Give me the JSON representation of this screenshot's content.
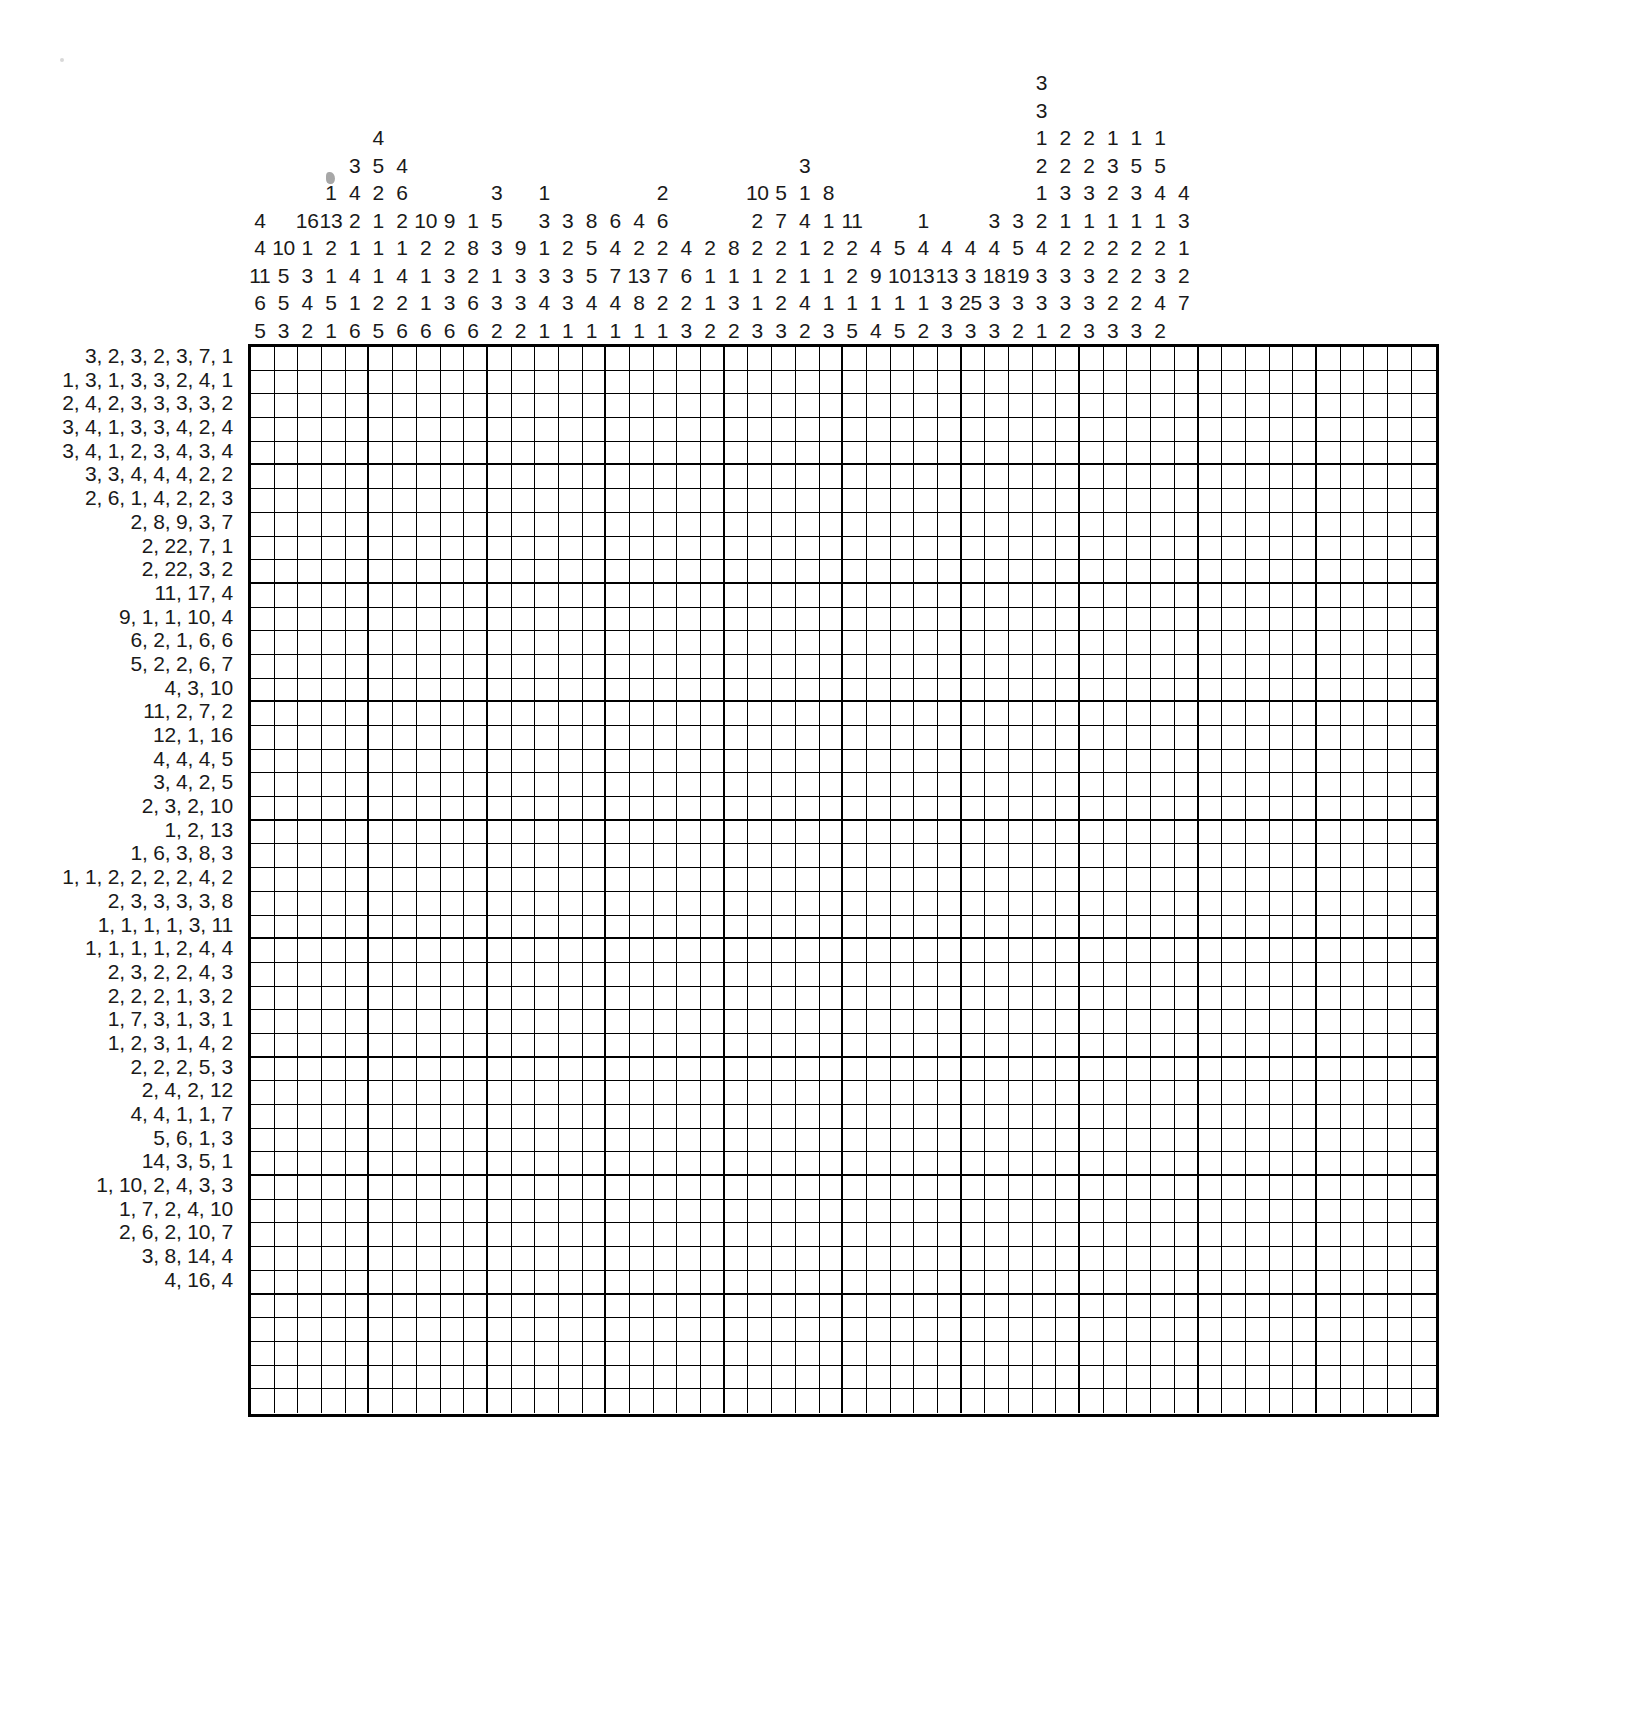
{
  "puzzle": {
    "type": "nonogram",
    "title": "Nonogram / Picross grid puzzle",
    "grid": {
      "columns": 50,
      "rows": 45,
      "block_size": 5
    },
    "colors": {
      "ink": "#1a1a1a",
      "grid_line": "#000000",
      "background": "#ffffff"
    },
    "artifact_label": "dust-speck"
  },
  "column_clues": [
    [
      4,
      11,
      6,
      5
    ],
    [
      4,
      10,
      5,
      5,
      3
    ],
    [
      16,
      1,
      3,
      4,
      2
    ],
    [
      1,
      13,
      2,
      1,
      5,
      1
    ],
    [
      3,
      4,
      2,
      1,
      4,
      1,
      6
    ],
    [
      4,
      5,
      2,
      1,
      1,
      1,
      2,
      5
    ],
    [
      4,
      6,
      2,
      1,
      4,
      2,
      6
    ],
    [
      10,
      2,
      1,
      1,
      6
    ],
    [
      9,
      2,
      3,
      3,
      6
    ],
    [
      1,
      2,
      8,
      2,
      6
    ],
    [
      3,
      5,
      3,
      1,
      3,
      2
    ],
    [
      9,
      3,
      3,
      2
    ],
    [
      1,
      3,
      1,
      3,
      1
    ],
    [
      8,
      2,
      3,
      3,
      1
    ],
    [
      6,
      5,
      5,
      4,
      1
    ],
    [
      4,
      4,
      7,
      4,
      1
    ],
    [
      6,
      2,
      13,
      8,
      1
    ],
    [
      2,
      7,
      2,
      3
    ],
    [
      6,
      2,
      2
    ],
    [
      8,
      1,
      1,
      2
    ],
    [
      10,
      2,
      2,
      1,
      3
    ],
    [
      5,
      7,
      2,
      1,
      2,
      3
    ],
    [
      1,
      4,
      1,
      2,
      1,
      2
    ],
    [
      8,
      1,
      2,
      4,
      3
    ],
    [
      11,
      2,
      2,
      1,
      2
    ],
    [
      4,
      9,
      1,
      5
    ],
    [
      5,
      10,
      1,
      4
    ],
    [
      4,
      13,
      1,
      5
    ],
    [
      1,
      4,
      13,
      1,
      2
    ],
    [
      4,
      3,
      3,
      3
    ],
    [
      4,
      18,
      25,
      3
    ],
    [
      3,
      5,
      19,
      3
    ],
    [
      3,
      3,
      2,
      1,
      2,
      4,
      3,
      3
    ],
    [
      3,
      1,
      2,
      2,
      1,
      3,
      1,
      2,
      3
    ],
    [
      2,
      2,
      3,
      1,
      2,
      3,
      3
    ],
    [
      1,
      3,
      2,
      1,
      2,
      2,
      2
    ],
    [
      1,
      5,
      3,
      1,
      2,
      2,
      2
    ],
    [
      1,
      2,
      3,
      1,
      2,
      3,
      2
    ],
    [
      1,
      3,
      4,
      1,
      2,
      2,
      2
    ],
    [
      4,
      3,
      1,
      2,
      7
    ]
  ],
  "column_clue_columns": [
    [
      "",
      "",
      "",
      "",
      "4",
      "4",
      "11",
      "6",
      "5"
    ],
    [
      "",
      "",
      "",
      "",
      "",
      "10",
      "5",
      "5",
      "3"
    ],
    [
      "",
      "",
      "",
      "",
      "16",
      "1",
      "3",
      "4",
      "2"
    ],
    [
      "",
      "",
      "",
      "1",
      "13",
      "2",
      "1",
      "5",
      "1"
    ],
    [
      "",
      "",
      "3",
      "4",
      "2",
      "1",
      "4",
      "1",
      "6"
    ],
    [
      "",
      "4",
      "5",
      "2",
      "1",
      "1",
      "1",
      "2",
      "5"
    ],
    [
      "",
      "",
      "4",
      "6",
      "2",
      "1",
      "4",
      "2",
      "6"
    ],
    [
      "",
      "",
      "",
      "",
      "10",
      "2",
      "1",
      "1",
      "6"
    ],
    [
      "",
      "",
      "",
      "",
      "9",
      "2",
      "3",
      "3",
      "6"
    ],
    [
      "",
      "",
      "",
      "",
      "1",
      "8",
      "2",
      "6",
      "6"
    ],
    [
      "",
      "",
      "",
      "3",
      "5",
      "3",
      "1",
      "3",
      "2"
    ],
    [
      "",
      "",
      "",
      "",
      "",
      "9",
      "3",
      "3",
      "2"
    ],
    [
      "",
      "",
      "",
      "1",
      "3",
      "1",
      "3",
      "4",
      "1"
    ],
    [
      "",
      "",
      "",
      "",
      "3",
      "2",
      "3",
      "3",
      "1"
    ],
    [
      "",
      "",
      "",
      "",
      "8",
      "5",
      "5",
      "4",
      "1"
    ],
    [
      "",
      "",
      "",
      "",
      "6",
      "4",
      "7",
      "4",
      "1"
    ],
    [
      "",
      "",
      "",
      "",
      "4",
      "2",
      "13",
      "8",
      "1"
    ],
    [
      "",
      "",
      "",
      "2",
      "6",
      "2",
      "7",
      "2",
      "1"
    ],
    [
      "",
      "",
      "",
      "",
      "",
      "4",
      "6",
      "2",
      "3"
    ],
    [
      "",
      "",
      "",
      "",
      "",
      "2",
      "1",
      "1",
      "2"
    ],
    [
      "",
      "",
      "",
      "",
      "",
      "8",
      "1",
      "3",
      "2"
    ],
    [
      "",
      "",
      "",
      "10",
      "2",
      "2",
      "1",
      "1",
      "3"
    ],
    [
      "",
      "",
      "",
      "5",
      "7",
      "2",
      "2",
      "2",
      "3"
    ],
    [
      "",
      "",
      "3",
      "1",
      "4",
      "1",
      "1",
      "4",
      "2"
    ],
    [
      "",
      "",
      "",
      "8",
      "1",
      "2",
      "1",
      "1",
      "3"
    ],
    [
      "",
      "",
      "",
      "",
      "11",
      "2",
      "2",
      "1",
      "5"
    ],
    [
      "",
      "",
      "",
      "",
      "",
      "4",
      "9",
      "1",
      "4"
    ],
    [
      "",
      "",
      "",
      "",
      "",
      "5",
      "10",
      "1",
      "5"
    ],
    [
      "",
      "",
      "",
      "",
      "1",
      "4",
      "13",
      "1",
      "2"
    ],
    [
      "",
      "",
      "",
      "",
      "",
      "4",
      "13",
      "3",
      "3"
    ],
    [
      "",
      "",
      "",
      "",
      "",
      "4",
      "3",
      "25",
      "3"
    ],
    [
      "",
      "",
      "",
      "",
      "3",
      "4",
      "18",
      "3",
      "3"
    ],
    [
      "",
      "",
      "",
      "",
      "3",
      "5",
      "19",
      "3",
      "2"
    ],
    [
      "3",
      "3",
      "1",
      "2",
      "2",
      "4",
      "3",
      "3",
      "1"
    ],
    [
      "",
      "",
      "2",
      "2",
      "3",
      "1",
      "2",
      "3",
      "2"
    ],
    [
      "",
      "",
      "2",
      "2",
      "3",
      "1",
      "2",
      "3",
      "3"
    ],
    [
      "",
      "",
      "1",
      "3",
      "2",
      "1",
      "2",
      "2",
      "3"
    ],
    [
      "",
      "",
      "1",
      "5",
      "3",
      "1",
      "2",
      "2",
      "3"
    ],
    [
      "",
      "",
      "1",
      "5",
      "4",
      "1",
      "2",
      "2",
      "2"
    ],
    [
      "",
      "",
      "",
      "4",
      "3",
      "1",
      "2",
      "7",
      ""
    ]
  ],
  "column_clue_grid": [
    [
      "",
      "",
      "",
      "",
      "",
      "4",
      "4",
      "11",
      "6",
      "5"
    ],
    [
      "",
      "",
      "",
      "",
      "",
      "",
      "10",
      "5",
      "5",
      "3"
    ],
    [
      "",
      "",
      "",
      "",
      "",
      "16",
      "1",
      "3",
      "4",
      "2"
    ],
    [
      "",
      "",
      "",
      "",
      "1",
      "13",
      "2",
      "1",
      "5",
      "1"
    ],
    [
      "",
      "",
      "",
      "3",
      "4",
      "2",
      "1",
      "4",
      "1",
      "6"
    ],
    [
      "",
      "",
      "4",
      "5",
      "2",
      "1",
      "1",
      "1",
      "2",
      "5"
    ],
    [
      "",
      "",
      "",
      "4",
      "6",
      "2",
      "1",
      "4",
      "2",
      "6"
    ],
    [
      "",
      "",
      "",
      "",
      "",
      "10",
      "2",
      "1",
      "1",
      "6"
    ],
    [
      "",
      "",
      "",
      "",
      "",
      "9",
      "2",
      "3",
      "3",
      "6"
    ],
    [
      "",
      "",
      "",
      "",
      "",
      "1",
      "8",
      "2",
      "6",
      "6"
    ],
    [
      "",
      "",
      "",
      "",
      "3",
      "5",
      "3",
      "1",
      "3",
      "2"
    ],
    [
      "",
      "",
      "",
      "",
      "",
      "",
      "9",
      "3",
      "3",
      "2"
    ],
    [
      "",
      "",
      "",
      "",
      "1",
      "3",
      "1",
      "3",
      "4",
      "1"
    ],
    [
      "",
      "",
      "",
      "",
      "",
      "3",
      "2",
      "3",
      "3",
      "1"
    ],
    [
      "",
      "",
      "",
      "",
      "",
      "8",
      "5",
      "5",
      "4",
      "1"
    ],
    [
      "",
      "",
      "",
      "",
      "",
      "6",
      "4",
      "7",
      "4",
      "1"
    ],
    [
      "",
      "",
      "",
      "",
      "",
      "4",
      "2",
      "13",
      "8",
      "1"
    ],
    [
      "",
      "",
      "",
      "",
      "2",
      "6",
      "2",
      "7",
      "2",
      "1"
    ],
    [
      "",
      "",
      "",
      "",
      "",
      "",
      "4",
      "6",
      "2",
      "3"
    ],
    [
      "",
      "",
      "",
      "",
      "",
      "",
      "2",
      "1",
      "1",
      "2"
    ],
    [
      "",
      "",
      "",
      "",
      "",
      "",
      "8",
      "1",
      "3",
      "2"
    ],
    [
      "",
      "",
      "",
      "",
      "10",
      "2",
      "2",
      "1",
      "1",
      "3"
    ],
    [
      "",
      "",
      "",
      "",
      "5",
      "7",
      "2",
      "2",
      "2",
      "3"
    ],
    [
      "",
      "",
      "",
      "3",
      "1",
      "4",
      "1",
      "1",
      "4",
      "2"
    ],
    [
      "",
      "",
      "",
      "",
      "8",
      "1",
      "2",
      "1",
      "1",
      "3"
    ],
    [
      "",
      "",
      "",
      "",
      "",
      "11",
      "2",
      "2",
      "1",
      "5"
    ],
    [
      "",
      "",
      "",
      "",
      "",
      "",
      "4",
      "9",
      "1",
      "4"
    ],
    [
      "",
      "",
      "",
      "",
      "",
      "",
      "5",
      "10",
      "1",
      "5"
    ],
    [
      "",
      "",
      "",
      "",
      "",
      "1",
      "4",
      "13",
      "1",
      "2"
    ],
    [
      "",
      "",
      "",
      "",
      "",
      "",
      "4",
      "13",
      "3",
      "3"
    ],
    [
      "",
      "",
      "",
      "",
      "",
      "",
      "4",
      "3",
      "25",
      "3"
    ],
    [
      "",
      "",
      "",
      "",
      "",
      "3",
      "4",
      "18",
      "3",
      "3"
    ],
    [
      "",
      "",
      "",
      "",
      "",
      "3",
      "5",
      "19",
      "3",
      "2"
    ],
    [
      "3",
      "3",
      "1",
      "2",
      "1",
      "2",
      "4",
      "3",
      "3",
      "1"
    ],
    [
      "",
      "",
      "2",
      "2",
      "3",
      "1",
      "2",
      "3",
      "3",
      "2"
    ],
    [
      "",
      "",
      "2",
      "2",
      "3",
      "1",
      "2",
      "3",
      "3",
      "3"
    ],
    [
      "",
      "",
      "1",
      "3",
      "2",
      "1",
      "2",
      "2",
      "2",
      "3"
    ],
    [
      "",
      "",
      "1",
      "5",
      "3",
      "1",
      "2",
      "2",
      "2",
      "3"
    ],
    [
      "",
      "",
      "1",
      "5",
      "4",
      "1",
      "2",
      "3",
      "4",
      "2"
    ],
    [
      "",
      "",
      "",
      "",
      "4",
      "3",
      "1",
      "2",
      "7",
      ""
    ]
  ],
  "row_clues": [
    "3, 2, 3, 2, 3, 7, 1",
    "1, 3, 1, 3, 3, 2, 4, 1",
    "2, 4, 2, 3, 3, 3, 3, 2",
    "3, 4, 1, 3, 3, 4, 2, 4",
    "3, 4, 1, 2, 3, 4, 3, 4",
    "3, 3, 4, 4, 4, 2, 2",
    "2, 6, 1, 4, 2, 2, 3",
    "2, 8, 9, 3, 7",
    "2, 22, 7, 1",
    "2, 22, 3, 2",
    "11, 17, 4",
    "9, 1, 1, 10, 4",
    "6, 2, 1, 6, 6",
    "5, 2, 2, 6, 7",
    "4, 3, 10",
    "11, 2, 7, 2",
    "12, 1, 16",
    "4, 4, 4, 5",
    "3, 4, 2, 5",
    "2, 3, 2, 10",
    "1, 2, 13",
    "1, 6, 3, 8, 3",
    "1, 1, 2, 2, 2, 2, 4, 2",
    "2, 3, 3, 3, 3, 8",
    "1, 1, 1, 1, 3, 11",
    "1, 1, 1, 1, 2, 4, 4",
    "2, 3, 2, 2, 4, 3",
    "2, 2, 2, 1, 3, 2",
    "1, 7, 3, 1, 3, 1",
    "1, 2, 3, 1, 4, 2",
    "2, 2, 2, 5, 3",
    "2, 4, 2, 12",
    "4, 4, 1, 1, 7",
    "5, 6, 1, 3",
    "14, 3, 5, 1",
    "1, 10, 2, 4, 3, 3",
    "1, 7, 2, 4, 10",
    "2, 6, 2, 10, 7",
    "3, 8, 14, 4",
    "4, 16, 4"
  ],
  "row_clues_full": [
    "3, 2, 3, 2, 3, 7, 1",
    "1, 3, 1, 3, 3, 2, 4, 1",
    "2, 4, 2, 3, 3, 3, 3, 2",
    "3, 4, 1, 3, 3, 4, 2, 4",
    "3, 4, 1, 2, 3, 4, 3, 4",
    "3, 3, 4, 4, 4, 2, 2",
    "2, 6, 1, 4, 2, 2, 3",
    "2, 8, 9, 3, 7",
    "2, 22, 7, 1",
    "2, 22, 3, 2",
    "11, 17, 4",
    "9, 1, 1, 10, 4",
    "6, 2, 1, 6, 6",
    "5, 2, 2, 6, 7",
    "4, 3, 10",
    "11, 2, 7, 2",
    "12, 1, 16",
    "4, 4, 4, 5",
    "3, 4, 2, 5",
    "2, 3, 2, 10",
    "1, 2, 13",
    "1, 6, 3, 8, 3",
    "1, 1, 2, 2, 2, 2, 4, 2",
    "2, 3, 3, 3, 3, 8",
    "1, 1, 1, 1, 3, 11",
    "1, 1, 1, 1, 2, 4, 4",
    "2, 3, 2, 2, 4, 3",
    "2, 2, 2, 1, 3, 2",
    "1, 7, 3, 1, 3, 1",
    "1, 2, 3, 1, 4, 2",
    "2, 2, 2, 5, 3",
    "2, 4, 2, 12",
    "4, 4, 1, 1, 7",
    "5, 6, 1, 3",
    "14, 3, 5, 1",
    "1, 10, 2, 4, 3, 3",
    "1, 7, 2, 4, 10",
    "2, 6, 2, 10, 7",
    "3, 8, 14, 4",
    "4, 16, 4"
  ]
}
